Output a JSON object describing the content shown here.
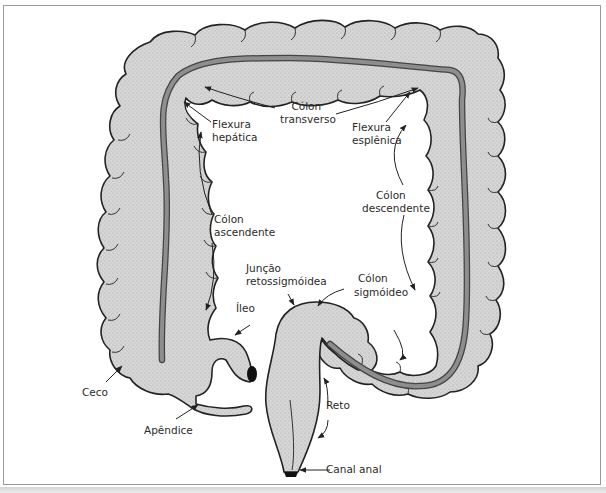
{
  "figure": {
    "colors": {
      "tissue_fill": "#d2d2d2",
      "outline": "#222222",
      "scope": "#7f7f7f",
      "frame": "#9a9a9a",
      "text": "#2b2b2b"
    }
  },
  "labels": {
    "colon_transverso": [
      "Cólon",
      "transverso"
    ],
    "flexura_hepatica": [
      "Flexura",
      "hepática"
    ],
    "flexura_esplenica": [
      "Flexura",
      "esplênica"
    ],
    "colon_ascendente": [
      "Cólon",
      "ascendente"
    ],
    "colon_descendente": [
      "Cólon",
      "descendente"
    ],
    "juncao_retossigmoidea": [
      "Junção",
      "retossigmóidea"
    ],
    "colon_sigmoideo": [
      "Cólon",
      "sigmóideo"
    ],
    "ileo": [
      "Íleo"
    ],
    "ceco": [
      "Ceco"
    ],
    "apendice": [
      "Apêndice"
    ],
    "reto": [
      "Reto"
    ],
    "canal_anal": [
      "Canal anal"
    ]
  }
}
